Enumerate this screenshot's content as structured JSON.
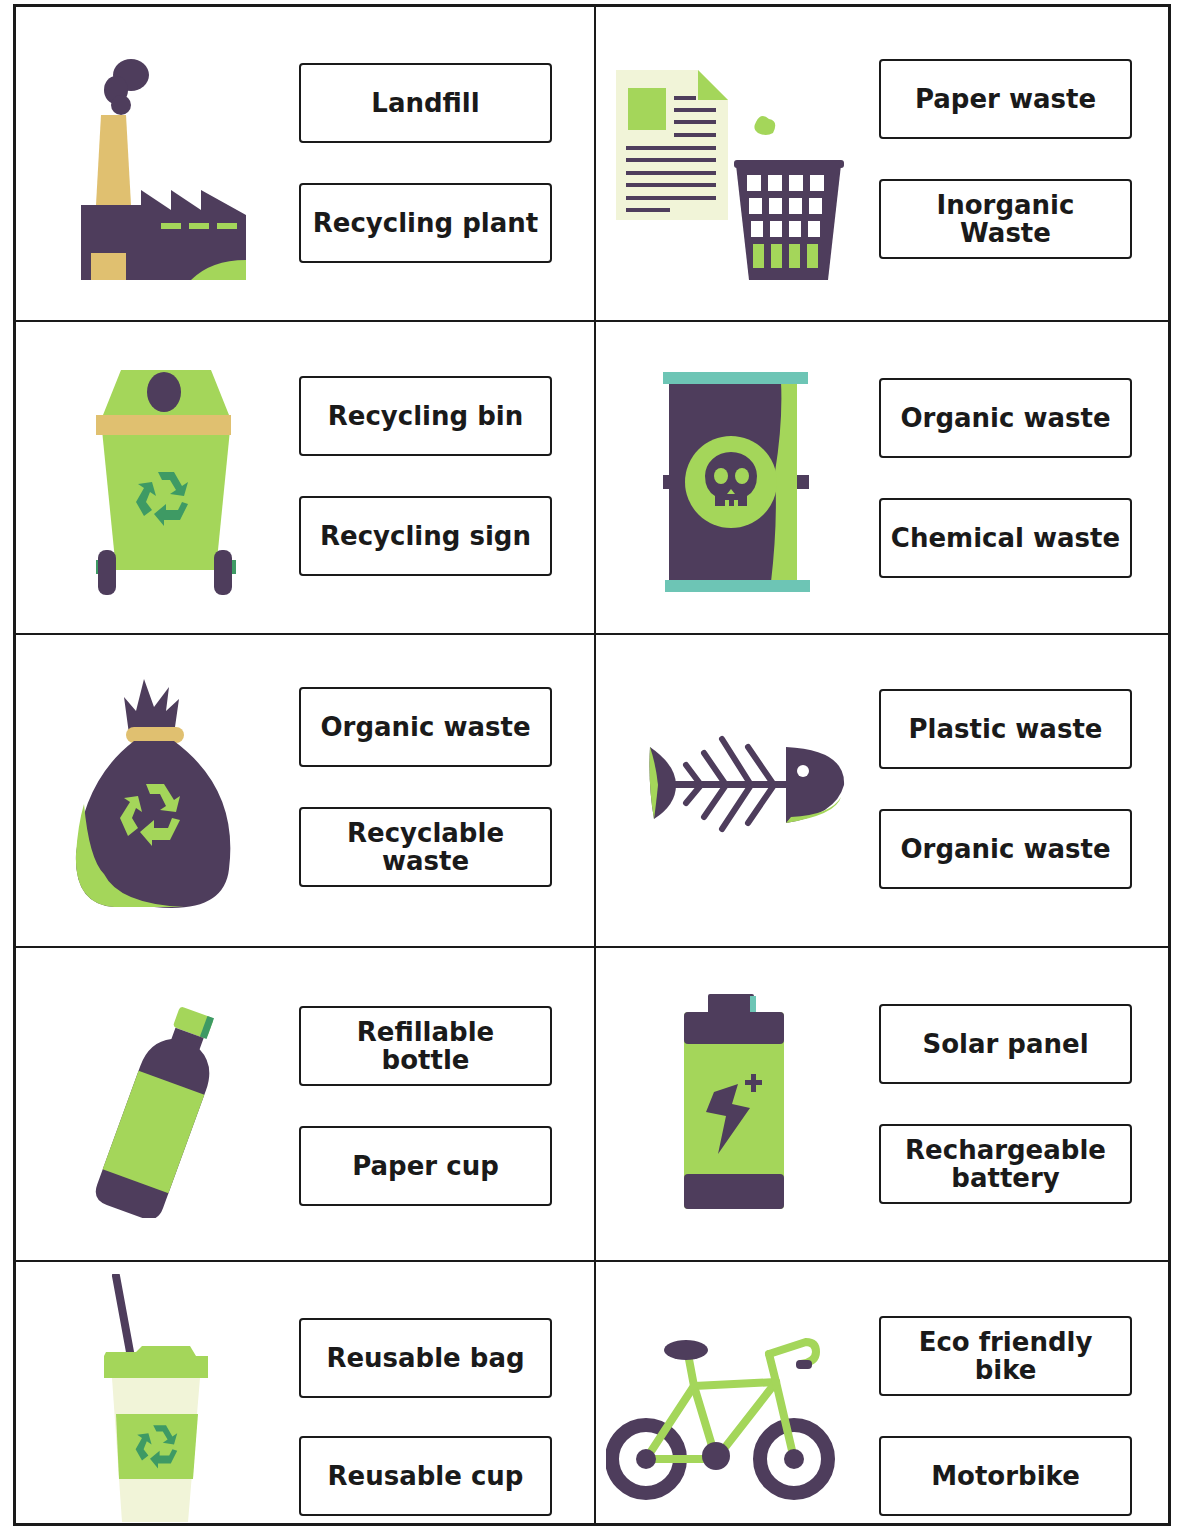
{
  "colors": {
    "purple": "#4e3d5c",
    "green": "#a4d65a",
    "dark_green": "#3e9a64",
    "teal": "#6dc5b5",
    "tan": "#e0c070",
    "cream": "#f1f4d8",
    "border": "#1a1a1a"
  },
  "cards": [
    {
      "icon": "factory-icon",
      "options": [
        "Landfill",
        "Recycling plant"
      ]
    },
    {
      "icon": "paper-wastebasket-icon",
      "options": [
        "Paper waste",
        "Inorganic Waste"
      ]
    },
    {
      "icon": "recycling-bin-icon",
      "options": [
        "Recycling bin",
        "Recycling sign"
      ]
    },
    {
      "icon": "toxic-barrel-icon",
      "options": [
        "Organic waste",
        "Chemical waste"
      ]
    },
    {
      "icon": "garbage-bag-icon",
      "options": [
        "Organic waste",
        "Recyclable waste"
      ]
    },
    {
      "icon": "fish-bone-icon",
      "options": [
        "Plastic waste",
        "Organic waste"
      ]
    },
    {
      "icon": "bottle-icon",
      "options": [
        "Refillable bottle",
        "Paper cup"
      ]
    },
    {
      "icon": "battery-icon",
      "options": [
        "Solar panel",
        "Rechargeable battery"
      ]
    },
    {
      "icon": "reusable-cup-icon",
      "options": [
        "Reusable bag",
        "Reusable cup"
      ]
    },
    {
      "icon": "bicycle-icon",
      "options": [
        "Eco friendly bike",
        "Motorbike"
      ]
    }
  ]
}
